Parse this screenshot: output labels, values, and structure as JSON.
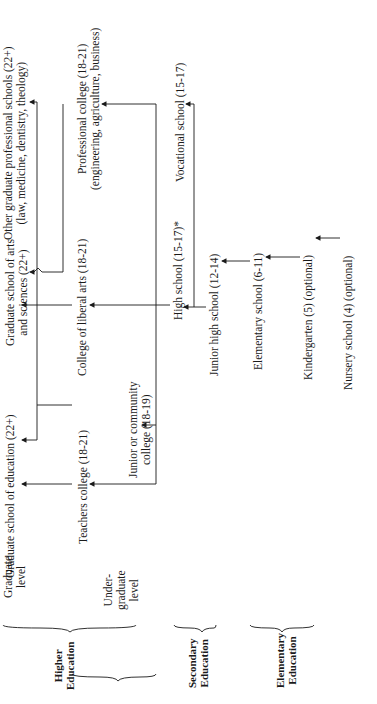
{
  "orientation": "rotated 90 degrees counter-clockwise",
  "levels": {
    "higher": {
      "label_line1": "Higher",
      "label_line2": "Education",
      "graduate": {
        "label_line1": "Graduate",
        "label_line2": "level"
      },
      "undergraduate": {
        "label_line1": "Under-",
        "label_line2": "graduate",
        "label_line3": "level"
      }
    },
    "secondary": {
      "label_line1": "Secondary",
      "label_line2": "Education"
    },
    "elementary": {
      "label_line1": "Elementary",
      "label_line2": "Education"
    }
  },
  "nodes": {
    "grad_education": {
      "line1": "Graduate school of education (22+)"
    },
    "grad_arts_sciences": {
      "line1": "Graduate school of arts",
      "line2": "and sciences (22+)"
    },
    "grad_professional": {
      "line1": "Other graduate professional schools (22+)",
      "line2": "(law, medicine, dentistry, theology)"
    },
    "teachers_college": {
      "line1": "Teachers college (18-21)"
    },
    "junior_college": {
      "line1": "Junior or community",
      "line2": "college (18-19)"
    },
    "liberal_arts": {
      "line1": "College of liberal arts (18-21)"
    },
    "professional_college": {
      "line1": "Professional college (18-21)",
      "line2": "(engineering, agriculture, business)"
    },
    "high_school": {
      "line1": "High school (15-17)*"
    },
    "vocational_school": {
      "line1": "Vocational school (15-17)"
    },
    "junior_high": {
      "line1": "Junior high school (12-14)"
    },
    "elementary_school": {
      "line1": "Elementary school (6-11)"
    },
    "kindergarten": {
      "line1": "Kindergarten (5) (optional)"
    },
    "nursery_school": {
      "line1": "Nursery school (4) (optional)"
    }
  },
  "colors": {
    "ink": "#1a1a1a",
    "background": "#ffffff"
  }
}
